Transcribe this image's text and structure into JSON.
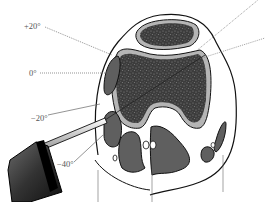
{
  "diagram": {
    "type": "anatomical cross-section with probe",
    "angle_labels": [
      {
        "id": "plus20",
        "text": "+20°",
        "x": 27,
        "y": 22
      },
      {
        "id": "zero",
        "text": "0°",
        "x": 31,
        "y": 69
      },
      {
        "id": "minus20",
        "text": "−20°",
        "x": 32,
        "y": 118
      },
      {
        "id": "minus40",
        "text": "−40°",
        "x": 58,
        "y": 163
      }
    ],
    "colors": {
      "bone_dark": "#3a3a3a",
      "cortex_light": "#b5b5b5",
      "muscle_gray": "#5f5f5f",
      "outline": "#111111",
      "probe_body": "#2a2a2a",
      "probe_highlight": "#8a8a8a",
      "dotted_line": "#666666"
    }
  }
}
